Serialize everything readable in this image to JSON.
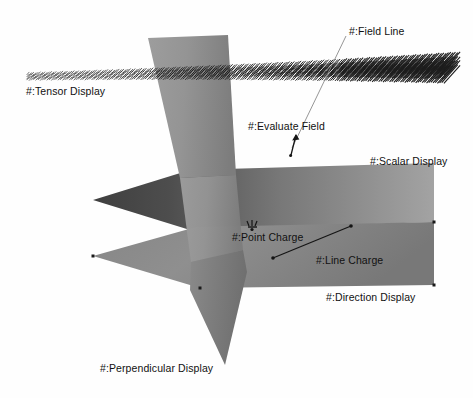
{
  "figure": {
    "kind": "3d-field-visualization-diagram",
    "background_color": "#fefefe",
    "label_color": "#111111",
    "width": 473,
    "height": 398
  },
  "labels": {
    "tensor_display": "#:Tensor Display",
    "field_line": "#:Field Line",
    "evaluate_field": "#:Evaluate Field",
    "scalar_display": "#:Scalar Display",
    "point_charge": "#:Point Charge",
    "line_charge": "#:Line Charge",
    "direction_display": "#:Direction Display",
    "perpendicular_display": "#:Perpendicular Display"
  },
  "surfaces": {
    "scalar_plane": {
      "name": "scalar-display-plane",
      "points": "93,200 190,170 434,163 434,222 190,230",
      "fill_dark": "#4a4a4a",
      "fill_light": "#9c9c9c"
    },
    "direction_plane": {
      "name": "direction-display-plane",
      "points": "93,256 196,227 434,222 434,285 200,288",
      "fill_dark": "#6e6e6e",
      "fill_light": "#a6a6a6"
    },
    "perpendicular_plane": {
      "name": "perpendicular-display-plane",
      "points": "148,38 228,35 247,272 225,365 190,288 178,120",
      "fill_dark": "#7b7b7b",
      "fill_light": "#a2a2a2"
    }
  },
  "tensor_field": {
    "name": "tensor-display-glyph-band",
    "glyph_color": "#1d1d1d",
    "glyph_count": 190,
    "band_left_x": 28,
    "band_right_x": 452,
    "band_left_y": 74,
    "band_right_y": 62
  },
  "markers": {
    "point_charge": {
      "x": 252,
      "y": 224,
      "color": "#1a1a1a"
    },
    "line_charge": {
      "x1": 273,
      "y1": 258,
      "x2": 351,
      "y2": 226,
      "color": "#1a1a1a"
    },
    "evaluate_field_arrow": {
      "x1": 291,
      "y1": 154,
      "x2": 296,
      "y2": 134,
      "color": "#1a1a1a"
    },
    "field_line_leader": {
      "x1": 346,
      "y1": 36,
      "x2": 292,
      "y2": 148,
      "color": "#777777"
    },
    "vertices": [
      {
        "x": 93,
        "y": 256
      },
      {
        "x": 434,
        "y": 222
      },
      {
        "x": 434,
        "y": 285
      },
      {
        "x": 200,
        "y": 288
      }
    ]
  }
}
